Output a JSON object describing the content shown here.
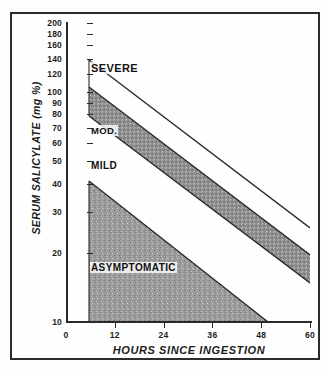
{
  "chart_data": {
    "type": "area",
    "xlabel": "HOURS SINCE INGESTION",
    "ylabel": "SERUM SALICYLATE (mg %)",
    "yscale": "log",
    "ylim": [
      10,
      200
    ],
    "xlim": [
      0,
      60
    ],
    "grid": false,
    "legend": "none",
    "xticks": [
      0,
      12,
      24,
      36,
      48,
      60
    ],
    "xtick_labels": [
      "0",
      "12",
      "24",
      "36",
      "48",
      "60"
    ],
    "yticks": [
      200,
      180,
      160,
      140,
      120,
      100,
      90,
      80,
      70,
      60,
      50,
      40,
      30,
      20,
      10
    ],
    "ytick_labels": [
      "200",
      "180",
      "160",
      "140",
      "120",
      "100",
      "90",
      "80",
      "70",
      "60",
      "50",
      "40",
      "30",
      "20",
      "10"
    ],
    "zones": [
      {
        "name": "SEVERE",
        "label": "SEVERE",
        "shaded": false,
        "fill": "#ffffff",
        "upper_boundary": [
          [
            6,
            130
          ],
          [
            60,
            28
          ]
        ],
        "description": "Region above the severe boundary line"
      },
      {
        "name": "SERIOUS",
        "label": "",
        "shaded": true,
        "fill": "#8d8d8d",
        "upper_boundary": [
          [
            6,
            90
          ],
          [
            60,
            20
          ]
        ],
        "lower_boundary": [
          [
            6,
            65
          ],
          [
            60,
            14
          ]
        ],
        "description": "Shaded band between severe and moderate"
      },
      {
        "name": "MODERATE",
        "label": "MOD.",
        "shaded": false,
        "fill": "#ffffff",
        "description": "White band labelled MOD."
      },
      {
        "name": "MILD",
        "label": "MILD",
        "shaded": true,
        "fill": "#8d8d8d",
        "upper_boundary": [
          [
            6,
            43
          ],
          [
            47,
            10
          ]
        ],
        "description": "Shaded triangular mild zone"
      },
      {
        "name": "ASYMPTOMATIC",
        "label": "ASYMPTOMATIC",
        "shaded": true,
        "fill": "#9a9a9a",
        "description": "Lowest shaded region labelled ASYMPTOMATIC"
      }
    ],
    "boundary_lines": [
      {
        "name": "severe-upper",
        "points": [
          [
            6,
            130
          ],
          [
            60,
            28
          ]
        ]
      },
      {
        "name": "severe-lower",
        "points": [
          [
            6,
            90
          ],
          [
            60,
            20
          ]
        ]
      },
      {
        "name": "moderate-upper",
        "points": [
          [
            6,
            65
          ],
          [
            60,
            14
          ]
        ]
      },
      {
        "name": "moderate-lower",
        "points": [
          [
            6,
            43
          ],
          [
            47,
            10
          ]
        ]
      }
    ]
  },
  "axes": {
    "x_title": "HOURS SINCE INGESTION",
    "y_title": "SERUM SALICYLATE (mg %)"
  },
  "labels": {
    "severe": "SEVERE",
    "moderate": "MOD.",
    "mild": "MILD",
    "asymptomatic": "ASYMPTOMATIC"
  },
  "colors": {
    "shading": "#8d8d8d",
    "ink": "#1d1d1d",
    "background": "#fdfdfc"
  }
}
